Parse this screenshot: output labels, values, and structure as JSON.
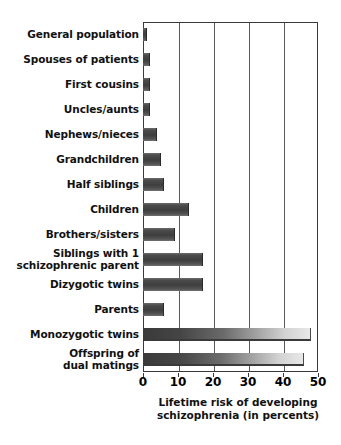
{
  "chart_data": {
    "type": "bar",
    "orientation": "horizontal",
    "title": "",
    "xlabel_line1": "Lifetime risk of developing",
    "xlabel_line2": "schizophrenia (in percents)",
    "ylabel": "",
    "xlim": [
      0,
      50
    ],
    "xticks": [
      0,
      10,
      20,
      30,
      40,
      50
    ],
    "xtick_labels": [
      "0",
      "10",
      "20",
      "30",
      "40",
      "50"
    ],
    "grid": "vertical",
    "legend": "none",
    "categories": [
      "General population",
      "Spouses of patients",
      "First cousins",
      "Uncles/aunts",
      "Nephews/nieces",
      "Grandchildren",
      "Half siblings",
      "Children",
      "Brothers/sisters",
      "Siblings with 1 schizophrenic parent",
      "Dizygotic twins",
      "Parents",
      "Monozygotic twins",
      "Offspring of dual matings"
    ],
    "values": [
      1,
      2,
      2,
      2,
      4,
      5,
      6,
      13,
      9,
      17,
      17,
      6,
      48,
      46
    ],
    "bars": [
      {
        "label_line1": "General population",
        "label_line2": "",
        "value": 1,
        "style": "solid"
      },
      {
        "label_line1": "Spouses of patients",
        "label_line2": "",
        "value": 2,
        "style": "solid"
      },
      {
        "label_line1": "First cousins",
        "label_line2": "",
        "value": 2,
        "style": "solid"
      },
      {
        "label_line1": "Uncles/aunts",
        "label_line2": "",
        "value": 2,
        "style": "solid"
      },
      {
        "label_line1": "Nephews/nieces",
        "label_line2": "",
        "value": 4,
        "style": "solid"
      },
      {
        "label_line1": "Grandchildren",
        "label_line2": "",
        "value": 5,
        "style": "solid"
      },
      {
        "label_line1": "Half siblings",
        "label_line2": "",
        "value": 6,
        "style": "solid"
      },
      {
        "label_line1": "Children",
        "label_line2": "",
        "value": 13,
        "style": "solid"
      },
      {
        "label_line1": "Brothers/sisters",
        "label_line2": "",
        "value": 9,
        "style": "solid"
      },
      {
        "label_line1": "Siblings with 1",
        "label_line2": "schizophrenic parent",
        "value": 17,
        "style": "solid"
      },
      {
        "label_line1": "Dizygotic twins",
        "label_line2": "",
        "value": 17,
        "style": "solid"
      },
      {
        "label_line1": "Parents",
        "label_line2": "",
        "value": 6,
        "style": "solid"
      },
      {
        "label_line1": "Monozygotic twins",
        "label_line2": "",
        "value": 48,
        "style": "gradient"
      },
      {
        "label_line1": "Offspring of",
        "label_line2": "dual matings",
        "value": 46,
        "style": "gradient"
      }
    ],
    "colors": {
      "bar_dark": "#3e3e3e",
      "bar_light": "#e8e8e8",
      "axis": "#3a3a3a",
      "grid": "#5a5a5a",
      "background": "#ffffff",
      "text": "#111111"
    }
  }
}
